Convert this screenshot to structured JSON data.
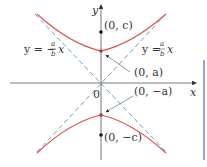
{
  "diagram": {
    "axes": {
      "x_label": "x",
      "y_label": "y",
      "origin_label": "0"
    },
    "points": [
      {
        "id": "focus-top",
        "label": "(0, c)"
      },
      {
        "id": "vertex-top",
        "label": "(0, a)"
      },
      {
        "id": "vertex-bottom",
        "label": "(0, −a)"
      },
      {
        "id": "focus-bottom",
        "label": "(0, −c)"
      }
    ],
    "asymptotes": [
      {
        "id": "asymptote-negative",
        "lhs": "y = −",
        "num": "a",
        "den": "b",
        "var": "x"
      },
      {
        "id": "asymptote-positive",
        "lhs": "y = ",
        "num": "a",
        "den": "b",
        "var": "x"
      }
    ],
    "colors": {
      "hyperbola": "#d9534f",
      "asymptote": "#6a9fc9",
      "axis": "#555555",
      "point": "#111111",
      "side_bar": "#8fa8d8"
    }
  }
}
